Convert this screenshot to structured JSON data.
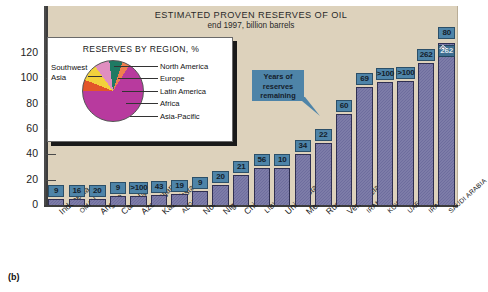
{
  "figure": {
    "caption": "(b)",
    "background_color": "#ddd2bc",
    "bar_color": "#6e6d9e",
    "chip_color": "#4e84a8"
  },
  "callout": {
    "line1": "Years of",
    "line2": "reserves",
    "line3": "remaining"
  },
  "inset": {
    "title": "RESERVES BY REGION, %",
    "southwest_asia_line1": "Southwest",
    "southwest_asia_line2": "Asia",
    "legend": [
      {
        "label": "North America",
        "color": "#e2562a",
        "percent": 6
      },
      {
        "label": "Europe",
        "color": "#f2d23c",
        "percent": 9
      },
      {
        "label": "Latin America",
        "color": "#e08ec0",
        "percent": 8
      },
      {
        "label": "Africa",
        "color": "#1f7a63",
        "percent": 7
      },
      {
        "label": "Asia-Pacific",
        "color": "#ef7f4e",
        "percent": 4
      },
      {
        "label": "Southwest Asia",
        "color": "#b83a9e",
        "percent": 66
      }
    ]
  },
  "chart_data": {
    "type": "bar",
    "title": "ESTIMATED PROVEN RESERVES OF OIL",
    "subtitle": "end 1997, billion barrels",
    "xlabel": "",
    "ylabel": "billion barrels",
    "ylim": [
      0,
      130
    ],
    "yticks": [
      0,
      20,
      40,
      60,
      80,
      100,
      120
    ],
    "grid": false,
    "legend_position": "none",
    "value_label_name": "Years of reserves remaining",
    "axis_break_on_last_bar": true,
    "categories": [
      "Indonesia",
      "OMAN",
      "Angola",
      "Canada",
      "Azerbaijan",
      "Kazakhstan",
      "ALGERIA",
      "Norway",
      "Nigeria",
      "China",
      "LIBYA",
      "United States",
      "Mexico",
      "Russia",
      "Venezuela",
      "IRAN",
      "KUWAIT",
      "UAE",
      "IRAQ",
      "SAUDI ARABIA"
    ],
    "label_style": [
      "normal",
      "small",
      "normal",
      "normal",
      "normal",
      "normal",
      "small",
      "normal",
      "normal",
      "normal",
      "small",
      "normal",
      "normal",
      "normal",
      "normal",
      "small",
      "small",
      "small",
      "small",
      "small"
    ],
    "series": [
      {
        "name": "Proven reserves (billion barrels)",
        "values": [
          5,
          5,
          5,
          7,
          7,
          8,
          9,
          11,
          16,
          24,
          29,
          29,
          40,
          49,
          72,
          93,
          97,
          98,
          112,
          262
        ]
      },
      {
        "name": "Years of reserves remaining",
        "values": [
          "9",
          "16",
          "20",
          "9",
          ">100",
          "43",
          "19",
          "9",
          "20",
          "21",
          "56",
          "10",
          "34",
          "22",
          "60",
          "69",
          ">100",
          ">100",
          "262",
          "80"
        ]
      }
    ]
  }
}
